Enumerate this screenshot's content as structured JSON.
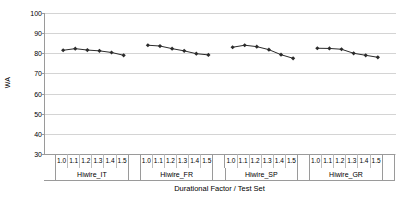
{
  "chart_data": {
    "type": "line",
    "title": "",
    "xlabel": "Durational Factor / Test Set",
    "ylabel": "WA",
    "ylim": [
      30,
      100
    ],
    "ytick_values": [
      100,
      90,
      80,
      70,
      60,
      50,
      40,
      30
    ],
    "ytick_labels": [
      "100",
      "90",
      "80",
      "70",
      "60",
      "50",
      "40",
      "30"
    ],
    "grid": true,
    "legend": "none",
    "marker": "diamond",
    "line_color": "#2b2b2b",
    "marker_color": "#2b2b2b",
    "grid_color": "#d4d4d4",
    "axis_color": "#9a9a9a",
    "categories": [
      "1.0",
      "1.1",
      "1.2",
      "1.3",
      "1.4",
      "1.5"
    ],
    "groups": [
      {
        "name": "Hiwire_IT",
        "x": [
          "1.0",
          "1.1",
          "1.2",
          "1.3",
          "1.4",
          "1.5"
        ],
        "values": [
          81.5,
          82.3,
          81.6,
          81.2,
          80.4,
          79.0
        ]
      },
      {
        "name": "Hiwire_FR",
        "x": [
          "1.0",
          "1.1",
          "1.2",
          "1.3",
          "1.4",
          "1.5"
        ],
        "values": [
          84.0,
          83.6,
          82.3,
          81.2,
          79.8,
          79.2
        ]
      },
      {
        "name": "Hiwire_SP",
        "x": [
          "1.0",
          "1.1",
          "1.2",
          "1.3",
          "1.4",
          "1.5"
        ],
        "values": [
          83.0,
          84.0,
          83.3,
          81.8,
          79.3,
          77.5
        ]
      },
      {
        "name": "Hiwire_GR",
        "x": [
          "1.0",
          "1.1",
          "1.2",
          "1.3",
          "1.4",
          "1.5"
        ],
        "values": [
          82.5,
          82.4,
          82.0,
          80.0,
          79.0,
          78.0
        ]
      }
    ]
  }
}
